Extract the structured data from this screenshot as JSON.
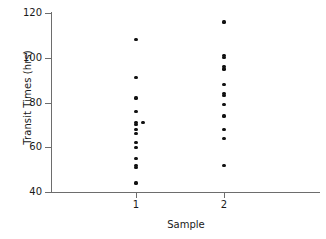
{
  "chart_data": {
    "type": "scatter",
    "title": "",
    "xlabel": "Sample",
    "ylabel": "Transit Times (hrs)",
    "ylim": [
      40,
      120
    ],
    "yticks": [
      40,
      60,
      80,
      100,
      120
    ],
    "ytick_labels": [
      "40",
      "60",
      "80",
      "100",
      "120"
    ],
    "xlim": [
      0.5,
      2.5
    ],
    "xticks": [
      1,
      2
    ],
    "xtick_labels": [
      "1",
      "2"
    ],
    "grid": false,
    "legend": false,
    "marker": "filled-circle",
    "marker_color": "#111111",
    "axis_color": "#6d6d6d",
    "series": [
      {
        "name": "Sample 1",
        "x_category": "1",
        "values": [
          108,
          91,
          82,
          76,
          71,
          71,
          70,
          68,
          66,
          62,
          60,
          55,
          52,
          51,
          44
        ],
        "points": [
          {
            "x": 1.0,
            "y": 108
          },
          {
            "x": 1.0,
            "y": 91
          },
          {
            "x": 1.0,
            "y": 82
          },
          {
            "x": 1.0,
            "y": 76
          },
          {
            "x": 1.0,
            "y": 71
          },
          {
            "x": 1.08,
            "y": 71
          },
          {
            "x": 1.0,
            "y": 70
          },
          {
            "x": 1.0,
            "y": 68
          },
          {
            "x": 1.0,
            "y": 66
          },
          {
            "x": 1.0,
            "y": 62
          },
          {
            "x": 1.0,
            "y": 60
          },
          {
            "x": 1.0,
            "y": 55
          },
          {
            "x": 1.0,
            "y": 52
          },
          {
            "x": 1.0,
            "y": 51
          },
          {
            "x": 1.0,
            "y": 44
          }
        ]
      },
      {
        "name": "Sample 2",
        "x_category": "2",
        "values": [
          116,
          101,
          100,
          96,
          95,
          88,
          84,
          83,
          79,
          74,
          68,
          64,
          52
        ],
        "points": [
          {
            "x": 2.0,
            "y": 116
          },
          {
            "x": 2.0,
            "y": 101
          },
          {
            "x": 2.0,
            "y": 100
          },
          {
            "x": 2.0,
            "y": 96
          },
          {
            "x": 2.0,
            "y": 95
          },
          {
            "x": 2.0,
            "y": 88
          },
          {
            "x": 2.0,
            "y": 84
          },
          {
            "x": 2.0,
            "y": 83
          },
          {
            "x": 2.0,
            "y": 79
          },
          {
            "x": 2.0,
            "y": 74
          },
          {
            "x": 2.0,
            "y": 68
          },
          {
            "x": 2.0,
            "y": 64
          },
          {
            "x": 2.0,
            "y": 52
          }
        ]
      }
    ]
  }
}
